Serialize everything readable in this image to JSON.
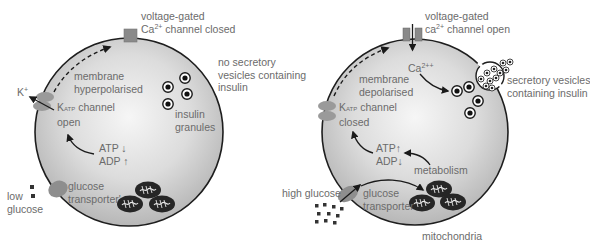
{
  "colors": {
    "cell_fill_center": "#f4f4f4",
    "cell_fill_edge": "#b9b9b9",
    "cell_outline": "#1e1e1e",
    "channel": "#8a8a8a",
    "label_text": "#6b6b6b",
    "arrow": "#1a1a1a",
    "mitochondria": "#262626"
  },
  "left_cell": {
    "ca_channel_label_line1": "voltage-gated",
    "ca_channel_label_line2_prefix": "Ca",
    "ca_channel_label_sup": "2+",
    "ca_channel_label_line2_suffix": " channel closed",
    "outside_note_line1": "no secretory",
    "outside_note_line2": "vesicles containing",
    "outside_note_line3": "insulin",
    "membrane_state_line1": "membrane",
    "membrane_state_line2": "hyperpolarised",
    "ion_label": "K",
    "ion_sup": "+",
    "katp_prefix": "K",
    "katp_sub": "ATP",
    "katp_suffix": " channel",
    "katp_state": "open",
    "granules_label_line1": "insulin",
    "granules_label_line2": "granules",
    "atp_label": "ATP ↓",
    "adp_label": "ADP ↑",
    "transporter_line1": "glucose",
    "transporter_line2": "transporter'",
    "glucose_line1": "low",
    "glucose_line2": "glucose"
  },
  "right_cell": {
    "ca_channel_label_line1": "voltage-gated",
    "ca_channel_label_line2_prefix": "ca",
    "ca_channel_label_sup": "2+",
    "ca_channel_label_line2_suffix": " channel open",
    "ca_ion_prefix": "Ca",
    "ca_ion_sup": "2++",
    "vesicles_line1": "secretory vesicles",
    "vesicles_line2": "containing insulin",
    "membrane_state_line1": "membrane",
    "membrane_state_line2": "depolarised",
    "katp_prefix": "K",
    "katp_sub": "ATP",
    "katp_suffix": " channel",
    "katp_state": "closed",
    "atp_label": "ATP↑",
    "adp_label": "ADP↓",
    "metabolism_label": "metabolism",
    "glucose_label": "high glucose",
    "transporter_line1": "glucose",
    "transporter_line2": "transporter",
    "mitochondria_label": "mitochondria"
  }
}
